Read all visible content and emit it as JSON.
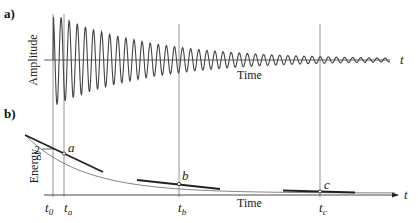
{
  "figure": {
    "panel_a": {
      "label": "a)",
      "y_axis_label": "Amplitude",
      "x_axis_label": "Time",
      "axis_var": "t"
    },
    "panel_b": {
      "label": "b)",
      "y_axis_label": "Energy",
      "x_axis_label": "Time",
      "axis_var": "t",
      "y_tick": "2",
      "points": [
        {
          "name": "a",
          "time_label": "t",
          "time_sub": "a"
        },
        {
          "name": "b",
          "time_label": "t",
          "time_sub": "b"
        },
        {
          "name": "c",
          "time_label": "t",
          "time_sub": "c"
        }
      ],
      "origin_time": {
        "label": "t",
        "sub": "0"
      }
    },
    "colors": {
      "curve": "#444444",
      "tangent": "#222222",
      "guide": "#888888",
      "axis": "#333333"
    }
  }
}
